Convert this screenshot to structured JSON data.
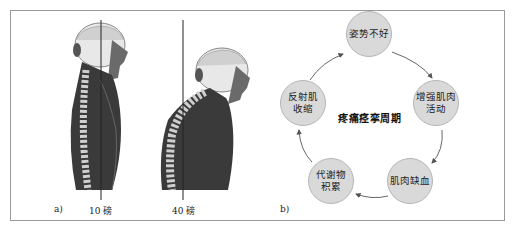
{
  "figure": {
    "panel_a": {
      "label": "a)",
      "figures": [
        {
          "name": "upright-posture",
          "load_label": "10 磅"
        },
        {
          "name": "forward-head-posture",
          "load_label": "40 磅"
        }
      ]
    },
    "panel_b": {
      "label": "b)",
      "cycle_title": "疼痛痉挛周期",
      "nodes": [
        {
          "text": "姿势不好"
        },
        {
          "text": "增强肌肉活动"
        },
        {
          "text": "肌肉缺血"
        },
        {
          "text": "代谢物积累"
        },
        {
          "text": "反射肌收缩"
        }
      ],
      "node_lines": {
        "n1": "增强肌肉",
        "n1b": "活动",
        "n3": "代谢物",
        "n3b": "积累",
        "n4": "反射肌",
        "n4b": "收缩"
      }
    },
    "colors": {
      "node_fill": "#d9d9d9",
      "node_border": "#b5b5b5",
      "arrow": "#555555",
      "frame": "#9a9a9a"
    }
  }
}
